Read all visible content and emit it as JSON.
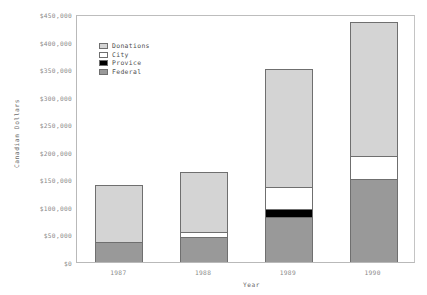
{
  "chart_data": {
    "type": "bar",
    "stacked": true,
    "title": "",
    "xlabel": "Year",
    "ylabel": "Canadian Dollars",
    "categories": [
      "1987",
      "1988",
      "1989",
      "1990"
    ],
    "ylim": [
      0,
      450000
    ],
    "ytick_values": [
      0,
      50000,
      100000,
      150000,
      200000,
      250000,
      300000,
      350000,
      400000,
      450000
    ],
    "ytick_labels": [
      "$0",
      "$50,000",
      "$100,000",
      "$150,000",
      "$200,000",
      "$250,000",
      "$300,000",
      "$350,000",
      "$400,000",
      "$450,000"
    ],
    "grid": false,
    "legend_position": "upper-left-inside",
    "series": [
      {
        "name": "Federal",
        "color": "#999999",
        "values": [
          36000,
          45000,
          82000,
          150000
        ]
      },
      {
        "name": "Provice",
        "color": "#000000",
        "values": [
          0,
          0,
          14000,
          0
        ]
      },
      {
        "name": "City",
        "color": "#ffffff",
        "values": [
          0,
          9000,
          40000,
          42000
        ]
      },
      {
        "name": "Donations",
        "color": "#d4d4d4",
        "values": [
          103000,
          109000,
          214000,
          243000
        ]
      }
    ],
    "totals": [
      139000,
      163000,
      350000,
      435000
    ],
    "legend_entries": [
      {
        "label": "Donations",
        "color": "#d4d4d4"
      },
      {
        "label": "City",
        "color": "#ffffff"
      },
      {
        "label": "Provice",
        "color": "#000000"
      },
      {
        "label": "Federal",
        "color": "#999999"
      }
    ]
  },
  "axes": {
    "y_title": "Canadian Dollars",
    "x_title": "Year",
    "y_ticks": [
      "$450,000",
      "$400,000",
      "$350,000",
      "$300,000",
      "$250,000",
      "$200,000",
      "$150,000",
      "$100,000",
      "$50,000",
      "$0"
    ],
    "x_ticks": [
      "1987",
      "1988",
      "1989",
      "1990"
    ]
  }
}
